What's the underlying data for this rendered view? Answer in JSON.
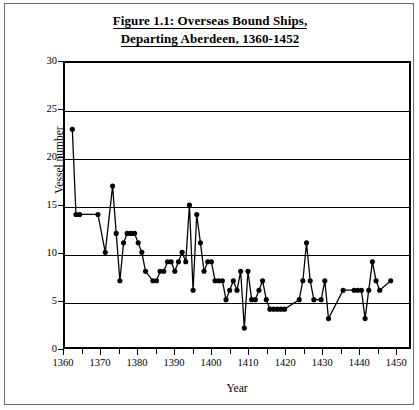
{
  "figure": {
    "title_line_1": "Figure 1.1: Overseas Bound Ships,",
    "title_line_2": "Departing Aberdeen, 1360-1452",
    "border_color": "#6b6b6b",
    "background": "#ffffff"
  },
  "chart_data": {
    "type": "line",
    "title": "Figure 1.1: Overseas Bound Ships, Departing Aberdeen, 1360-1452",
    "xlabel": "Year",
    "ylabel": "Vessel number",
    "xlim": [
      1360,
      1454
    ],
    "ylim": [
      0,
      30
    ],
    "ytick_labels": [
      "0",
      "5",
      "10",
      "15",
      "20",
      "25",
      "30"
    ],
    "ytick_values": [
      0,
      5,
      10,
      15,
      20,
      25,
      30
    ],
    "ytick_step": 5,
    "xtick_labels": [
      "1360",
      "1370",
      "1380",
      "1390",
      "1400",
      "1410",
      "1420",
      "1430",
      "1440",
      "1450"
    ],
    "xtick_values": [
      1360,
      1370,
      1380,
      1390,
      1400,
      1410,
      1420,
      1430,
      1440,
      1450
    ],
    "xtick_minor_step": 5,
    "grid": "horizontal",
    "legend": "none",
    "marker": "filled-circle",
    "marker_color": "#000000",
    "line_color": "#000000",
    "series": [
      {
        "name": "Vessel number",
        "points": [
          [
            1362,
            23
          ],
          [
            1363,
            14
          ],
          [
            1364,
            14
          ],
          [
            1369,
            14
          ],
          [
            1371,
            10
          ],
          [
            1373,
            17
          ],
          [
            1374,
            12
          ],
          [
            1375,
            7
          ],
          [
            1376,
            11
          ],
          [
            1377,
            12
          ],
          [
            1378,
            12
          ],
          [
            1379,
            12
          ],
          [
            1380,
            11
          ],
          [
            1381,
            10
          ],
          [
            1382,
            8
          ],
          [
            1384,
            7
          ],
          [
            1385,
            7
          ],
          [
            1386,
            8
          ],
          [
            1387,
            8
          ],
          [
            1388,
            9
          ],
          [
            1389,
            9
          ],
          [
            1390,
            8
          ],
          [
            1391,
            9
          ],
          [
            1392,
            10
          ],
          [
            1393,
            9
          ],
          [
            1394,
            15
          ],
          [
            1395,
            6
          ],
          [
            1396,
            14
          ],
          [
            1397,
            11
          ],
          [
            1398,
            8
          ],
          [
            1399,
            9
          ],
          [
            1400,
            9
          ],
          [
            1401,
            7
          ],
          [
            1402,
            7
          ],
          [
            1403,
            7
          ],
          [
            1404,
            5
          ],
          [
            1405,
            6
          ],
          [
            1406,
            7
          ],
          [
            1407,
            6
          ],
          [
            1408,
            8
          ],
          [
            1409,
            2
          ],
          [
            1410,
            8
          ],
          [
            1411,
            5
          ],
          [
            1412,
            5
          ],
          [
            1413,
            6
          ],
          [
            1414,
            7
          ],
          [
            1415,
            5
          ],
          [
            1416,
            4
          ],
          [
            1417,
            4
          ],
          [
            1418,
            4
          ],
          [
            1419,
            4
          ],
          [
            1420,
            4
          ],
          [
            1424,
            5
          ],
          [
            1425,
            7
          ],
          [
            1426,
            11
          ],
          [
            1427,
            7
          ],
          [
            1428,
            5
          ],
          [
            1430,
            5
          ],
          [
            1431,
            7
          ],
          [
            1432,
            3
          ],
          [
            1436,
            6
          ],
          [
            1439,
            6
          ],
          [
            1440,
            6
          ],
          [
            1441,
            6
          ],
          [
            1442,
            3
          ],
          [
            1443,
            6
          ],
          [
            1444,
            9
          ],
          [
            1445,
            7
          ],
          [
            1446,
            6
          ],
          [
            1449,
            7
          ]
        ]
      }
    ]
  }
}
